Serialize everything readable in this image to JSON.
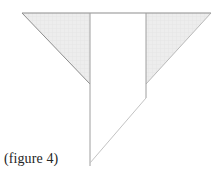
{
  "figure": {
    "caption": "(figure 4)",
    "background_color": "#ffffff",
    "stroke_color": "#9a9a9a",
    "dark_stroke_color": "#6f6f6f",
    "light_stroke_color": "#c8c8c8",
    "fill_color": "#ececec",
    "hatch_color": "#dcdcdc",
    "caption_color": "#242424",
    "shapes": {
      "left_triangle": {
        "name": "left-shaded-triangle",
        "points": "22,13 90,13 90,84",
        "filled": true
      },
      "right_triangle": {
        "name": "right-shaded-triangle",
        "points": "146,13 211,13 146,84",
        "filled": true
      },
      "top_edge": {
        "name": "top-horizontal-edge",
        "x1": 22,
        "y1": 13,
        "x2": 211,
        "y2": 13
      },
      "left_vertical": {
        "name": "left-vertical-edge",
        "x1": 90,
        "y1": 13,
        "x2": 90,
        "y2": 166
      },
      "right_vertical": {
        "name": "right-vertical-edge",
        "x1": 146,
        "y1": 13,
        "x2": 146,
        "y2": 98
      },
      "lower_diagonal": {
        "name": "lower-diagonal-edge",
        "x1": 146,
        "y1": 98,
        "x2": 90,
        "y2": 163
      },
      "left_hypotenuse": {
        "name": "left-triangle-hypotenuse",
        "x1": 22,
        "y1": 13,
        "x2": 90,
        "y2": 84
      },
      "right_hypotenuse": {
        "name": "right-triangle-hypotenuse",
        "x1": 211,
        "y1": 13,
        "x2": 146,
        "y2": 84
      }
    }
  }
}
